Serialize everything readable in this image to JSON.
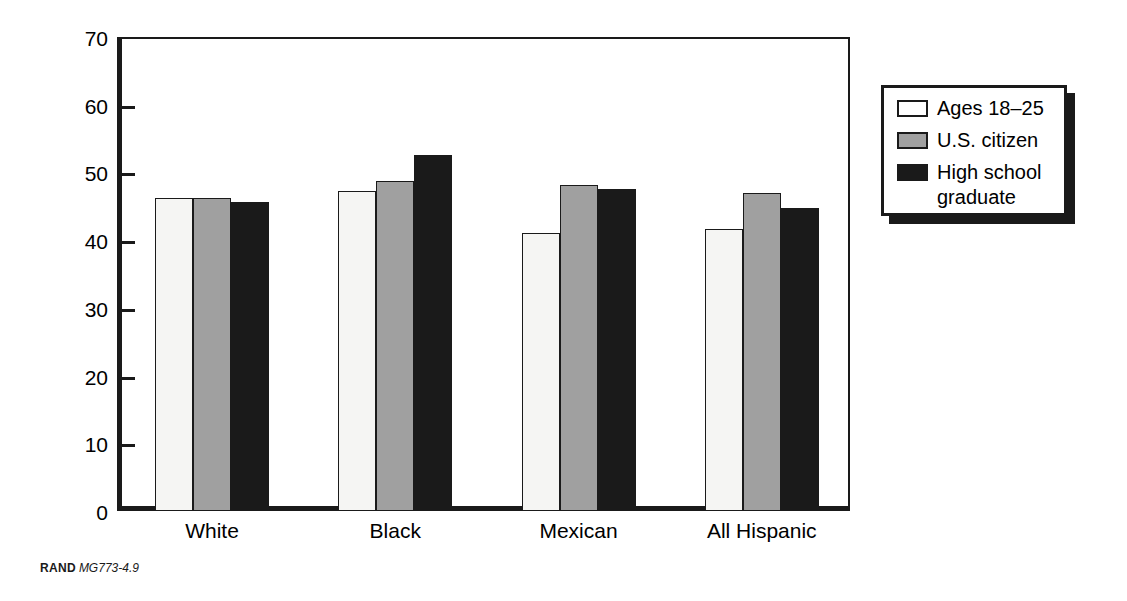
{
  "caption": {
    "brand": "RAND",
    "id": "MG773-4.9"
  },
  "axes": {
    "ylabel": "Percent",
    "yticks": [
      "0",
      "10",
      "20",
      "30",
      "40",
      "50",
      "60",
      "70"
    ]
  },
  "legend": {
    "items": [
      {
        "label": "Ages 18–25",
        "color": "#ffffff"
      },
      {
        "label": "U.S. citizen",
        "color": "#a0a0a0"
      },
      {
        "label": "High school\ngraduate",
        "color": "#1a1a1a"
      }
    ]
  },
  "chart_data": {
    "type": "bar",
    "title": "",
    "xlabel": "",
    "ylabel": "Percent",
    "ylim": [
      0,
      70
    ],
    "ytick_step": 10,
    "grid": false,
    "legend_position": "right-outside",
    "categories": [
      "White",
      "Black",
      "Mexican",
      "All Hispanic"
    ],
    "series": [
      {
        "name": "Ages 18–25",
        "color": "#f5f5f3",
        "values": [
          46.2,
          47.2,
          41.0,
          41.7
        ]
      },
      {
        "name": "U.S. citizen",
        "color": "#a0a0a0",
        "values": [
          46.2,
          48.8,
          48.2,
          47.0
        ]
      },
      {
        "name": "High school graduate",
        "color": "#1a1a1a",
        "values": [
          45.6,
          52.6,
          47.6,
          44.7
        ]
      }
    ]
  }
}
